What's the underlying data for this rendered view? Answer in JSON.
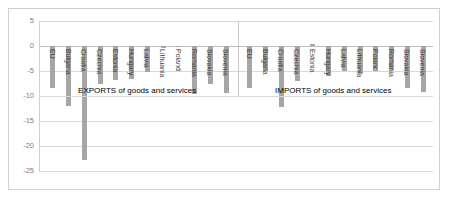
{
  "chart_data": {
    "type": "bar",
    "title": "",
    "xlabel": "",
    "ylabel": "",
    "ylim": [
      -25,
      5
    ],
    "yticks": [
      5,
      0,
      -5,
      -10,
      -15,
      -20,
      -25
    ],
    "grid": true,
    "legend": "none",
    "annotations": [
      "EXPORTS of goods and services",
      "IMPORTS of goods and services"
    ],
    "groups": [
      {
        "name": "EXPORTS of goods and services",
        "categories": [
          "EU",
          "Bulgaria",
          "Croatia",
          "Czechia",
          "Estonia",
          "Hungary",
          "Latvia",
          "Lithuania",
          "Poland",
          "Romania",
          "Slovakia",
          "Slovenia"
        ],
        "values": [
          -8.4,
          -12.0,
          -22.7,
          -7.5,
          -6.8,
          -6.5,
          -5.2,
          -0.4,
          0.0,
          -9.5,
          -7.5,
          -9.3
        ]
      },
      {
        "name": "IMPORTS of goods and services",
        "categories": [
          "EU",
          "Bulgaria",
          "Croatia",
          "Czechia",
          "Estonia",
          "Hungary",
          "Latvia",
          "Lithuania",
          "Poland",
          "Romania",
          "Slovakia",
          "Slovenia"
        ],
        "values": [
          -8.4,
          -5.0,
          -12.2,
          -7.0,
          0.4,
          -6.0,
          -5.0,
          -5.5,
          -4.6,
          -4.7,
          -8.3,
          -9.2
        ]
      }
    ]
  },
  "axis": {
    "labels": [
      "5",
      "0",
      "-5",
      "-10",
      "-15",
      "-20",
      "-25"
    ]
  }
}
